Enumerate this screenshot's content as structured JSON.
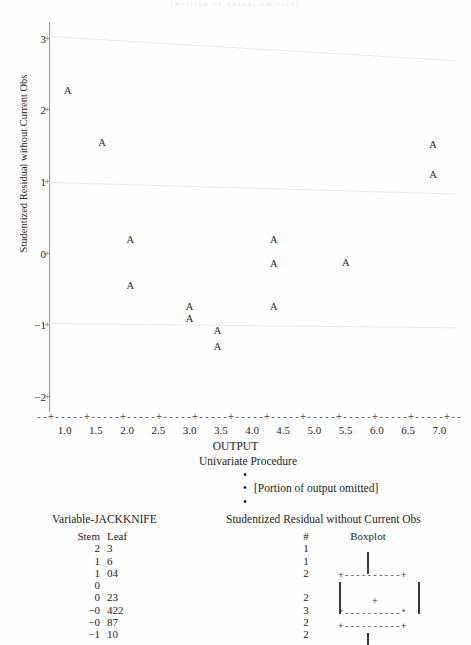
{
  "ghost_header": "· · [Portion of output omitted] · ·",
  "chart_data": {
    "type": "scatter",
    "title": "",
    "xlabel": "OUTPUT",
    "ylabel": "Studentized Residual without Current Obs",
    "xlim": [
      0.75,
      7.25
    ],
    "ylim": [
      -2.2,
      3.25
    ],
    "xticks": [
      "1.0",
      "1.5",
      "2.0",
      "2.5",
      "3.0",
      "3.5",
      "4.0",
      "4.5",
      "5.0",
      "5.5",
      "6.0",
      "6.5",
      "7.0"
    ],
    "ytickvals": [
      3,
      2,
      1,
      0,
      -1,
      -2
    ],
    "yticks": [
      "3",
      "2",
      "1",
      "0",
      "−1",
      "−2"
    ],
    "point_marker": "A",
    "grid": false,
    "legend": "none",
    "points": [
      {
        "x": 1.05,
        "y": 2.3
      },
      {
        "x": 1.6,
        "y": 1.58
      },
      {
        "x": 2.05,
        "y": 0.22
      },
      {
        "x": 2.05,
        "y": -0.42
      },
      {
        "x": 3.0,
        "y": -0.72
      },
      {
        "x": 3.0,
        "y": -0.88
      },
      {
        "x": 3.45,
        "y": -1.05
      },
      {
        "x": 3.45,
        "y": -1.28
      },
      {
        "x": 4.35,
        "y": 0.22
      },
      {
        "x": 4.35,
        "y": -0.12
      },
      {
        "x": 4.35,
        "y": -0.72
      },
      {
        "x": 5.5,
        "y": -0.1
      },
      {
        "x": 6.9,
        "y": 1.55
      },
      {
        "x": 6.9,
        "y": 1.12
      }
    ],
    "reference_lines": [
      {
        "name": "upper-reference-line",
        "y_left": 3.06,
        "y_right": 2.72
      },
      {
        "name": "mid-reference-line",
        "y_left": 1.02,
        "y_right": 0.86
      },
      {
        "name": "lower-reference-line",
        "y_left": -0.96,
        "y_right": -1.02
      }
    ]
  },
  "univariate": {
    "title": "Univariate Procedure",
    "bullet": "•",
    "omitted_note": "[Portion of output omitted]",
    "variable_label": "Variable-JACKKNIFE",
    "column_title": "Studentized Residual without Current Obs",
    "headers": {
      "stem": "Stem",
      "leaf": "Leaf",
      "count": "#",
      "boxplot": "Boxplot"
    },
    "rows": [
      {
        "stem": "2",
        "leaf": "3",
        "count": "1"
      },
      {
        "stem": "1",
        "leaf": "6",
        "count": "1"
      },
      {
        "stem": "1",
        "leaf": "04",
        "count": "2"
      },
      {
        "stem": "0",
        "leaf": "",
        "count": ""
      },
      {
        "stem": "0",
        "leaf": "23",
        "count": "2"
      },
      {
        "stem": "−0",
        "leaf": "422",
        "count": "3"
      },
      {
        "stem": "−0",
        "leaf": "87",
        "count": "2"
      },
      {
        "stem": "−1",
        "leaf": "10",
        "count": "2"
      }
    ],
    "boxplot_art": {
      "upper_fence": "+----------+",
      "median_line": "*----------*",
      "lower_fence": "+----------+",
      "mean_marker": "+"
    }
  }
}
